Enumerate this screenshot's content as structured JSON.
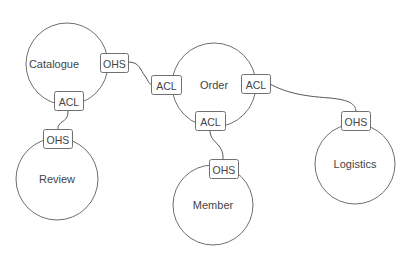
{
  "diagram": {
    "type": "context-map",
    "contexts": [
      {
        "id": "catalogue",
        "label": "Catalogue",
        "cx": 67,
        "cy": 64,
        "r": 41,
        "label_dx": -13
      },
      {
        "id": "order",
        "label": "Order",
        "cx": 214,
        "cy": 85,
        "r": 42,
        "label_dx": 0
      },
      {
        "id": "review",
        "label": "Review",
        "cx": 57,
        "cy": 179,
        "r": 41,
        "label_dx": 0
      },
      {
        "id": "member",
        "label": "Member",
        "cx": 213,
        "cy": 205,
        "r": 40,
        "label_dx": 0
      },
      {
        "id": "logistics",
        "label": "Logistics",
        "cx": 355,
        "cy": 164,
        "r": 40,
        "label_dx": 0
      }
    ],
    "badges": [
      {
        "id": "catalogue-ohs",
        "context": "catalogue",
        "label": "OHS",
        "x": 100,
        "y": 53,
        "w": 28,
        "h": 19
      },
      {
        "id": "catalogue-acl",
        "context": "catalogue",
        "label": "ACL",
        "x": 54,
        "y": 91,
        "w": 29,
        "h": 19
      },
      {
        "id": "order-acl-left",
        "context": "order",
        "label": "ACL",
        "x": 151,
        "y": 75,
        "w": 30,
        "h": 19
      },
      {
        "id": "order-acl-right",
        "context": "order",
        "label": "ACL",
        "x": 241,
        "y": 74,
        "w": 29,
        "h": 19
      },
      {
        "id": "order-acl-bottom",
        "context": "order",
        "label": "ACL",
        "x": 195,
        "y": 111,
        "w": 30,
        "h": 19
      },
      {
        "id": "review-ohs",
        "context": "review",
        "label": "OHS",
        "x": 43,
        "y": 129,
        "w": 29,
        "h": 19
      },
      {
        "id": "member-ohs",
        "context": "member",
        "label": "OHS",
        "x": 209,
        "y": 159,
        "w": 29,
        "h": 19
      },
      {
        "id": "logistics-ohs",
        "context": "logistics",
        "label": "OHS",
        "x": 341,
        "y": 111,
        "w": 29,
        "h": 19
      }
    ],
    "relationships": [
      {
        "from": "catalogue-ohs",
        "to": "order-acl-left",
        "path": "M128,62 C140,62 140,70 145,76 C149,82 149,84 151,84"
      },
      {
        "from": "catalogue-acl",
        "to": "review-ohs",
        "path": "M68,110 C68,118 66,119 62,122 C58,125 58,127 58,129"
      },
      {
        "from": "order-acl-right",
        "to": "logistics-ohs",
        "path": "M270,84 C285,92 300,96 330,98 C350,100 355,104 356,111"
      },
      {
        "from": "order-acl-bottom",
        "to": "member-ohs",
        "path": "M210,130 C210,138 214,140 219,146 C223,151 223,155 223,159"
      }
    ]
  }
}
